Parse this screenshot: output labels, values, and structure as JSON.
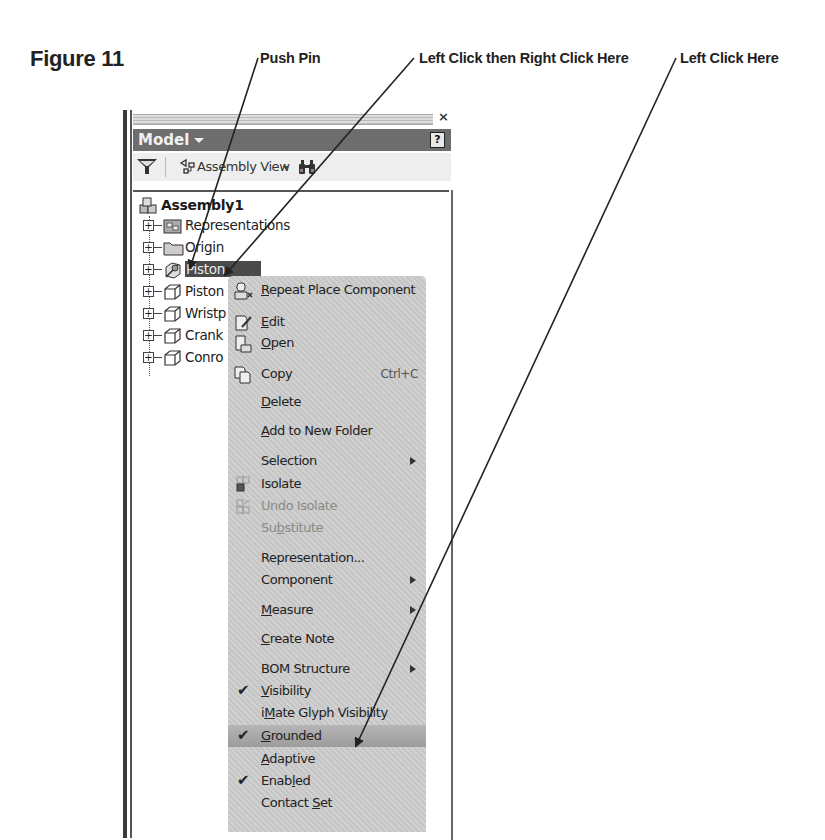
{
  "figure": {
    "label": "Figure 11"
  },
  "callouts": [
    {
      "id": "push-pin",
      "label": "Push Pin"
    },
    {
      "id": "left-right-click",
      "label": "Left Click then Right Click Here"
    },
    {
      "id": "left-click",
      "label": "Left Click Here"
    }
  ],
  "panel": {
    "title": "Model",
    "close_glyph": "×",
    "help_glyph": "?",
    "toolbar": {
      "view_label": "Assembly View"
    },
    "tree": {
      "root": "Assembly1",
      "items": [
        {
          "label": "Representations",
          "icon": "representations-icon"
        },
        {
          "label": "Origin",
          "icon": "folder-icon"
        },
        {
          "label": "Piston",
          "icon": "grounded-part-icon",
          "selected": true
        },
        {
          "label": "Piston",
          "icon": "part-icon"
        },
        {
          "label": "Wristp",
          "icon": "part-icon"
        },
        {
          "label": "Crank",
          "icon": "part-icon"
        },
        {
          "label": "Conro",
          "icon": "part-icon"
        }
      ]
    }
  },
  "context_menu": {
    "items": [
      {
        "label": "Repeat Place Component",
        "u": "R",
        "rest": "epeat Place Component",
        "icon": "repeat-place-icon"
      },
      {
        "label": "Edit",
        "u": "E",
        "rest": "dit",
        "icon": "edit-icon"
      },
      {
        "label": "Open",
        "u": "O",
        "rest": "pen",
        "icon": "open-icon"
      },
      {
        "label": "Copy",
        "u": "",
        "rest": "Copy",
        "icon": "copy-icon",
        "shortcut": "Ctrl+C"
      },
      {
        "label": "Delete",
        "u": "D",
        "rest": "elete"
      },
      {
        "label": "Add to New Folder",
        "u": "A",
        "rest": "dd to New Folder"
      },
      {
        "label": "Selection",
        "u": "",
        "rest": "Selection",
        "submenu": true
      },
      {
        "label": "Isolate",
        "u": "",
        "rest": "Isolate",
        "icon": "isolate-icon"
      },
      {
        "label": "Undo Isolate",
        "u": "",
        "rest": "Undo Isolate",
        "icon": "undo-isolate-icon",
        "disabled": true
      },
      {
        "label": "Substitute",
        "pre": "Su",
        "u": "b",
        "rest": "stitute",
        "disabled": true
      },
      {
        "label": "Representation...",
        "u": "",
        "rest": "Representation..."
      },
      {
        "label": "Component",
        "u": "",
        "rest": "Component",
        "submenu": true
      },
      {
        "label": "Measure",
        "u": "M",
        "rest": "easure",
        "submenu": true
      },
      {
        "label": "Create Note",
        "u": "C",
        "rest": "reate Note"
      },
      {
        "label": "BOM Structure",
        "u": "",
        "rest": "BOM Structure",
        "submenu": true
      },
      {
        "label": "Visibility",
        "u": "V",
        "rest": "isibility",
        "checked": true
      },
      {
        "label": "iMate Glyph Visibility",
        "pre": "i",
        "u": "M",
        "rest": "ate Glyph Visibility"
      },
      {
        "label": "Grounded",
        "u": "G",
        "rest": "rounded",
        "checked": true,
        "highlight": true
      },
      {
        "label": "Adaptive",
        "u": "A",
        "rest": "daptive"
      },
      {
        "label": "Enabled",
        "pre": "Enab",
        "u": "l",
        "rest": "ed",
        "checked": true
      },
      {
        "label": "Contact Set",
        "pre": "Contact ",
        "u": "S",
        "rest": "et"
      }
    ]
  },
  "colors": {
    "title_bar": "#6d6d6d",
    "menu_bg": "#cdcdcd",
    "selected_bg": "#4a4a4a"
  }
}
